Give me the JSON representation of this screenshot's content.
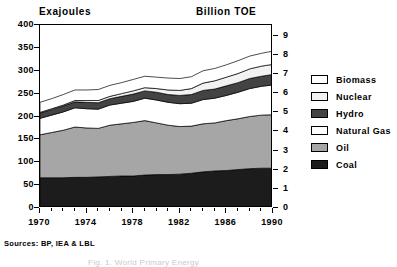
{
  "chart_data": {
    "type": "area",
    "title": "",
    "subtitle": "",
    "xlabel": "",
    "ylabel": "Exajoules",
    "ylabel_secondary": "Billion TOE",
    "ylim": [
      0,
      400
    ],
    "ylim_secondary": [
      0,
      9.556
    ],
    "yticks": [
      0,
      50,
      100,
      150,
      200,
      250,
      300,
      350,
      400
    ],
    "yticks_secondary": [
      0,
      1,
      2,
      3,
      4,
      5,
      6,
      7,
      8,
      9
    ],
    "xlim": [
      1970,
      1990
    ],
    "xticks_labeled": [
      1970,
      1974,
      1978,
      1982,
      1986,
      1990
    ],
    "xticks_all": [
      1970,
      1971,
      1972,
      1973,
      1974,
      1975,
      1976,
      1977,
      1978,
      1979,
      1980,
      1981,
      1982,
      1983,
      1984,
      1985,
      1986,
      1987,
      1988,
      1989,
      1990
    ],
    "x": [
      1970,
      1971,
      1972,
      1973,
      1974,
      1975,
      1976,
      1977,
      1978,
      1979,
      1980,
      1981,
      1982,
      1983,
      1984,
      1985,
      1986,
      1987,
      1988,
      1989,
      1990
    ],
    "grid": false,
    "legend_position": "right",
    "stacked": true,
    "stack_order_bottom_to_top": [
      "Coal",
      "Oil",
      "Natural Gas",
      "Hydro",
      "Nuclear",
      "Biomass"
    ],
    "series": [
      {
        "name": "Coal",
        "color": "#1c1c1c",
        "values": [
          66,
          66,
          66,
          67,
          67,
          68,
          69,
          70,
          70,
          72,
          73,
          73,
          74,
          76,
          79,
          81,
          82,
          84,
          86,
          87,
          87
        ]
      },
      {
        "name": "Oil",
        "color": "#a6a6a6",
        "values": [
          94,
          99,
          104,
          110,
          108,
          106,
          112,
          114,
          117,
          119,
          113,
          108,
          104,
          103,
          105,
          105,
          109,
          111,
          114,
          116,
          117
        ]
      },
      {
        "name": "Natural Gas",
        "color": "#ffffff",
        "values": [
          36,
          38,
          40,
          42,
          42,
          42,
          44,
          45,
          46,
          49,
          50,
          50,
          50,
          50,
          53,
          54,
          55,
          58,
          61,
          63,
          65
        ]
      },
      {
        "name": "Hydro",
        "color": "#434343",
        "values": [
          12,
          12,
          13,
          13,
          14,
          14,
          14,
          15,
          16,
          16,
          17,
          17,
          18,
          19,
          20,
          20,
          21,
          21,
          22,
          22,
          23
        ]
      },
      {
        "name": "Nuclear",
        "color": "#f2f2f2",
        "values": [
          1,
          2,
          2,
          3,
          4,
          5,
          5,
          6,
          7,
          7,
          8,
          10,
          11,
          13,
          16,
          18,
          19,
          20,
          21,
          22,
          22
        ]
      },
      {
        "name": "Biomass",
        "color": "#ffffff",
        "values": [
          22,
          22,
          23,
          23,
          23,
          24,
          24,
          24,
          25,
          25,
          25,
          26,
          26,
          26,
          27,
          27,
          27,
          28,
          28,
          28,
          29
        ]
      }
    ],
    "totals": [
      231,
      239,
      248,
      258,
      258,
      259,
      268,
      274,
      281,
      288,
      286,
      284,
      283,
      287,
      300,
      305,
      313,
      322,
      332,
      338,
      343
    ]
  },
  "legend": {
    "items": [
      {
        "label": "Biomass",
        "color": "#ffffff"
      },
      {
        "label": "Nuclear",
        "color": "#f2f2f2"
      },
      {
        "label": "Hydro",
        "color": "#434343"
      },
      {
        "label": "Natural Gas",
        "color": "#ffffff"
      },
      {
        "label": "Oil",
        "color": "#a6a6a6"
      },
      {
        "label": "Coal",
        "color": "#1c1c1c"
      }
    ]
  },
  "axes": {
    "left_unit": "Exajoules",
    "right_unit": "Billion TOE",
    "left_ticks": [
      "400",
      "350",
      "300",
      "250",
      "200",
      "150",
      "100",
      "50",
      "0"
    ],
    "right_ticks": [
      "9",
      "8",
      "7",
      "6",
      "5",
      "4",
      "3",
      "2",
      "1",
      "0"
    ],
    "x_ticks": [
      "1970",
      "1974",
      "1978",
      "1982",
      "1986",
      "1990"
    ]
  },
  "notes": {
    "sources": "Sources: BP, IEA & LBL",
    "caption": "Fig. 1. World Primary Energy"
  }
}
